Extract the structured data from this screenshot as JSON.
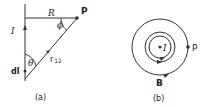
{
  "figure_a": {
    "caption": "(a)",
    "labels": {
      "R": "R",
      "P": "P",
      "phi": "ϕ",
      "I": "I",
      "theta": "θ",
      "r12": "r",
      "r12_sub": "12",
      "dl": "dl"
    }
  },
  "figure_b": {
    "caption": "(b)",
    "labels": {
      "I": "I",
      "P": "P",
      "B": "B"
    }
  },
  "colors": {
    "stroke": "#333333",
    "background": "#ffffff"
  }
}
